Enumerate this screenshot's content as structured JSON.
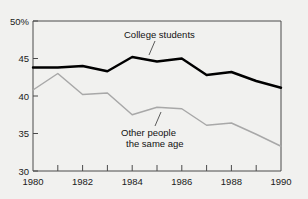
{
  "chart_data": {
    "type": "line",
    "title": "",
    "subtitle": "",
    "xlabel": "",
    "ylabel": "",
    "x": [
      1980,
      1981,
      1982,
      1983,
      1984,
      1985,
      1986,
      1987,
      1988,
      1989,
      1990
    ],
    "xlim": [
      1980,
      1990
    ],
    "ylim": [
      30,
      50
    ],
    "grid": false,
    "legend_position": "inline-annotation",
    "y_tick_values": [
      30,
      35,
      40,
      45,
      50
    ],
    "y_tick_labels": [
      "30",
      "35",
      "40",
      "45",
      "50%"
    ],
    "x_tick_values": [
      1980,
      1982,
      1984,
      1986,
      1988,
      1990
    ],
    "x_tick_labels": [
      "1980",
      "1982",
      "1984",
      "1986",
      "1988",
      "1990"
    ],
    "x_minor_tick_values": [
      1981,
      1983,
      1985,
      1987,
      1989
    ],
    "series": [
      {
        "name": "College students",
        "color": "#000000",
        "values": [
          43.8,
          43.8,
          44.0,
          43.3,
          45.2,
          44.6,
          45.0,
          42.8,
          43.2,
          42.0,
          41.1
        ]
      },
      {
        "name": "Other people the same age",
        "color": "#a8a8a8",
        "values": [
          40.8,
          43.0,
          40.2,
          40.4,
          37.5,
          38.5,
          38.3,
          36.1,
          36.4,
          34.9,
          33.3
        ]
      }
    ],
    "annotations": [
      {
        "id": "college-students",
        "text": "College students",
        "text_lines": [
          "College students"
        ]
      },
      {
        "id": "other-people",
        "text": "Other people the same age",
        "text_lines": [
          "Other people",
          "the same age"
        ]
      }
    ]
  },
  "colors": {
    "background": "#f1f1ef",
    "axis": "#4a4a4a",
    "series_primary": "#000000",
    "series_secondary": "#a8a8a8",
    "text": "#111111"
  }
}
